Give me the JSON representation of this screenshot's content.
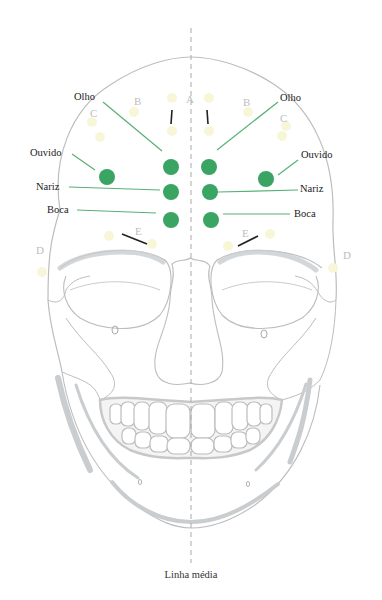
{
  "figure": {
    "caption": "Linha média",
    "colors": {
      "acupoint": "#3aa463",
      "leader_line": "#57b077",
      "outline": "#b8b8b8",
      "shade": "#c9cdcf",
      "midline": "#a9a9a9",
      "zone_label": "#bdbdbd",
      "zone_spot": "#f7f7d8",
      "tick": "#222222"
    },
    "labels_left": {
      "eye": "Olho",
      "ear": "Ouvido",
      "nose": "Nariz",
      "mouth": "Boca"
    },
    "labels_right": {
      "eye": "Olho",
      "ear": "Ouvido",
      "nose": "Nariz",
      "mouth": "Boca"
    },
    "zones": {
      "a": "A",
      "b_left": "B",
      "b_right": "B",
      "c_left": "C",
      "c_right": "C",
      "d_left": "D",
      "d_right": "D",
      "e_left": "E",
      "e_right": "E"
    }
  }
}
